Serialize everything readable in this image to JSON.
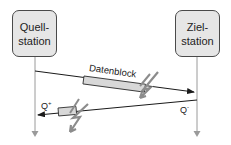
{
  "diagram": {
    "source_station": {
      "line1": "Quell-",
      "line2": "station"
    },
    "target_station": {
      "line1": "Ziel-",
      "line2": "station"
    },
    "data_block_label": "Datenblock",
    "ack_positive": {
      "base": "Q",
      "sup": "+"
    },
    "ack_negative": {
      "base": "Q",
      "sup": "-"
    },
    "colors": {
      "box_fill": "#e6e6e6",
      "box_stroke": "#4a4a4a",
      "arrow": "#222222",
      "lifeline": "#9a9a9a",
      "lightning": "#8c8c8c",
      "block_fill": "#d8d8d8"
    }
  }
}
